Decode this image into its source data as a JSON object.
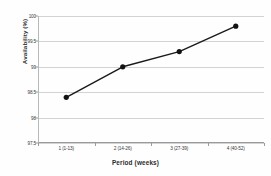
{
  "chart_data": {
    "type": "line",
    "title": "",
    "subtitle": "",
    "xlabel": "Period (weeks)",
    "ylabel": "Availability (%)",
    "categories": [
      "1 (1-13)",
      "2 (14-26)",
      "3 (27-39)",
      "4 (40-52)"
    ],
    "values": [
      98.4,
      99.0,
      99.3,
      99.8
    ],
    "series": [
      {
        "name": "Availability",
        "values": [
          98.4,
          99.0,
          99.3,
          99.8
        ],
        "color": "#1a1a1a",
        "marker": "filled-circle"
      }
    ],
    "ylim": [
      97.5,
      100
    ],
    "ytick_labels": [
      "100",
      "99.5",
      "99",
      "98.5",
      "98",
      "97.5"
    ],
    "ytick_values": [
      100,
      99.5,
      99,
      98.5,
      98,
      97.5
    ],
    "grid": "horizontal",
    "legend": "none",
    "annotations": []
  },
  "axes": {
    "y_title": "Availability (%)",
    "x_title": "Period (weeks)"
  },
  "colors": {
    "line": "#1a1a1a",
    "marker": "#121212",
    "gridline": "#d3d3d3",
    "axis": "#9a9a9a",
    "background": "#fefefe",
    "tick_text": "#3a3a3a"
  }
}
